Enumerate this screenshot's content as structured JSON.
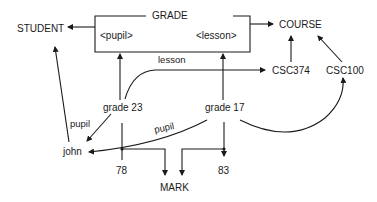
{
  "diagram": {
    "entities": {
      "grade": "GRADE",
      "student": "STUDENT",
      "course": "COURSE",
      "mark": "MARK"
    },
    "roles": {
      "pupil": "<pupil>",
      "lesson": "<lesson>"
    },
    "instances": {
      "grade23": "grade 23",
      "grade17": "grade 17",
      "john": "john",
      "csc374": "CSC374",
      "csc100": "CSC100",
      "mark78": "78",
      "mark83": "83"
    },
    "edge_labels": {
      "lesson": "lesson",
      "pupil_left": "pupil",
      "pupil_mid": "pupil"
    }
  }
}
